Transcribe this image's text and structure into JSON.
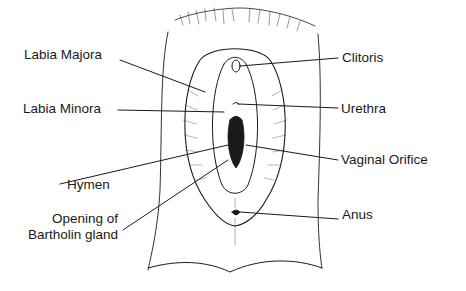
{
  "diagram": {
    "type": "labeled anatomical line drawing",
    "labels_left": [
      {
        "id": "labia-majora",
        "text": "Labia Majora"
      },
      {
        "id": "labia-minora",
        "text": "Labia Minora"
      },
      {
        "id": "hymen",
        "text": "Hymen"
      },
      {
        "id": "bartholin",
        "lines": [
          "Opening of",
          "Bartholin gland"
        ]
      }
    ],
    "labels_right": [
      {
        "id": "clitoris",
        "text": "Clitoris"
      },
      {
        "id": "urethra",
        "text": "Urethra"
      },
      {
        "id": "vaginal-orifice",
        "text": "Vaginal Orifice"
      },
      {
        "id": "anus",
        "text": "Anus"
      }
    ],
    "colors": {
      "ink": "#1a1a1a",
      "background": "#ffffff"
    }
  }
}
